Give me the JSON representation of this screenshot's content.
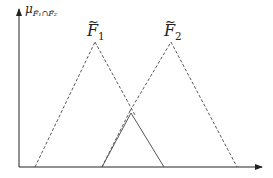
{
  "diagram": {
    "y_axis_label": {
      "symbol": "μ",
      "subscript_left": "F̃₁",
      "operator": "∩",
      "subscript_right": "F̃₂"
    },
    "sets": [
      {
        "name": "F",
        "subscript": "1",
        "tilde": "~",
        "left_base_x": 35,
        "peak_x": 95,
        "peak_y": 42,
        "right_base_x": 164
      },
      {
        "name": "F",
        "subscript": "2",
        "tilde": "~",
        "left_base_x": 102,
        "peak_x": 171,
        "peak_y": 42,
        "right_base_x": 237
      }
    ],
    "axis": {
      "origin_x": 19,
      "origin_y": 167,
      "y_top": 8,
      "x_right": 263
    },
    "colors": {
      "axis": "#222222",
      "dashed": "#444444",
      "solid": "#555555"
    }
  }
}
